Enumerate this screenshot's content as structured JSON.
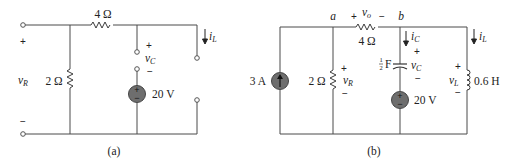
{
  "figure": {
    "panels": [
      {
        "id": "a",
        "caption": "(a)",
        "components": {
          "series_resistor": {
            "value": "4 Ω"
          },
          "shunt_resistor": {
            "value": "2 Ω"
          },
          "voltage_source": {
            "value": "20 V",
            "polarity_top": "+",
            "polarity_bottom": "−"
          }
        },
        "labels": {
          "vR": {
            "base": "v",
            "sub": "R",
            "plus": "+",
            "minus": "−"
          },
          "vC": {
            "base": "v",
            "sub": "C",
            "plus": "+",
            "minus": "−"
          },
          "iL": {
            "base": "i",
            "sub": "L"
          }
        }
      },
      {
        "id": "b",
        "caption": "(b)",
        "nodes": {
          "a": "a",
          "b": "b"
        },
        "components": {
          "current_source": {
            "value": "3 A"
          },
          "shunt_resistor": {
            "value": "2 Ω"
          },
          "series_resistor": {
            "value": "4 Ω"
          },
          "capacitor": {
            "value_num": "1",
            "value_den": "2",
            "unit": "F"
          },
          "voltage_source": {
            "value": "20 V",
            "polarity_top": "+",
            "polarity_bottom": "−"
          },
          "inductor": {
            "value": "0.6 H"
          }
        },
        "labels": {
          "vo": {
            "base": "v",
            "sub": "o",
            "plus": "+",
            "minus": "−"
          },
          "vR": {
            "base": "v",
            "sub": "R",
            "plus": "+",
            "minus": "−"
          },
          "iC": {
            "base": "i",
            "sub": "C"
          },
          "vC": {
            "base": "v",
            "sub": "C",
            "plus": "+",
            "minus": "−"
          },
          "iL": {
            "base": "i",
            "sub": "L"
          },
          "vL": {
            "base": "v",
            "sub": "L",
            "plus": "+",
            "minus": "−"
          }
        }
      }
    ]
  }
}
